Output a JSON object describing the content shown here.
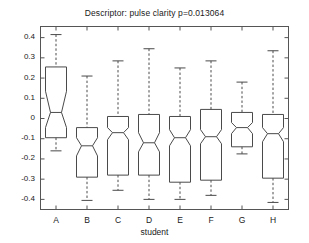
{
  "chart_data": {
    "type": "box",
    "title": "Descriptor: pulse clarity p=0.013064",
    "xlabel": "student",
    "ylabel": "",
    "categories": [
      "A",
      "B",
      "C",
      "D",
      "E",
      "F",
      "G",
      "H"
    ],
    "ytick_labels": [
      "0.4",
      "0.3",
      "0.2",
      "0.1",
      "0",
      "-0.1",
      "-0.2",
      "-0.3",
      "-0.4"
    ],
    "ytick_values": [
      0.4,
      0.3,
      0.2,
      0.1,
      0,
      -0.1,
      -0.2,
      -0.3,
      -0.4
    ],
    "ylim": [
      -0.45,
      0.455
    ],
    "grid": false,
    "legend": "none",
    "notched": true,
    "boxes": [
      {
        "category": "A",
        "whisker_high": 0.415,
        "q3": 0.255,
        "notch_high": 0.135,
        "median": 0.03,
        "notch_low": -0.045,
        "q1": -0.095,
        "whisker_low": -0.16
      },
      {
        "category": "B",
        "whisker_high": 0.21,
        "q3": -0.045,
        "notch_high": -0.095,
        "median": -0.135,
        "notch_low": -0.185,
        "q1": -0.29,
        "whisker_low": -0.405
      },
      {
        "category": "C",
        "whisker_high": 0.285,
        "q3": 0.01,
        "notch_high": -0.045,
        "median": -0.07,
        "notch_low": -0.105,
        "q1": -0.28,
        "whisker_low": -0.355
      },
      {
        "category": "D",
        "whisker_high": 0.345,
        "q3": 0.02,
        "notch_high": -0.07,
        "median": -0.12,
        "notch_low": -0.165,
        "q1": -0.28,
        "whisker_low": -0.4
      },
      {
        "category": "E",
        "whisker_high": 0.25,
        "q3": 0.01,
        "notch_high": -0.055,
        "median": -0.095,
        "notch_low": -0.135,
        "q1": -0.315,
        "whisker_low": -0.4
      },
      {
        "category": "F",
        "whisker_high": 0.285,
        "q3": 0.045,
        "notch_high": -0.055,
        "median": -0.09,
        "notch_low": -0.125,
        "q1": -0.305,
        "whisker_low": -0.38
      },
      {
        "category": "G",
        "whisker_high": 0.18,
        "q3": 0.03,
        "notch_high": -0.02,
        "median": -0.045,
        "notch_low": -0.075,
        "q1": -0.14,
        "whisker_low": -0.175
      },
      {
        "category": "H",
        "whisker_high": 0.335,
        "q3": 0.02,
        "notch_high": -0.045,
        "median": -0.075,
        "notch_low": -0.115,
        "q1": -0.295,
        "whisker_low": -0.415
      }
    ]
  }
}
